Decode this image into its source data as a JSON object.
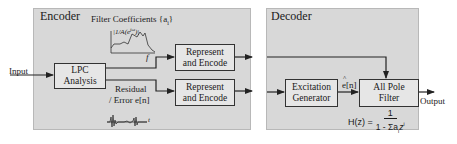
{
  "encoder": {
    "title": "Encoder",
    "lpc_box": "LPC\nAnalysis",
    "filter_coeff_label": "Filter Coefficients {a",
    "filter_coeff_sub": "i",
    "filter_coeff_close": "}",
    "spectrum_label": "|1/A(e",
    "spectrum_sup": "jω",
    "spectrum_close": ")|",
    "spectrum_axis": "f",
    "represent_top": "Represent\nand Encode",
    "represent_bottom": "Represent\nand Encode",
    "residual_label_1": "Residual",
    "residual_label_2": "/ Error e[n]",
    "residual_axis": "t"
  },
  "decoder": {
    "title": "Decoder",
    "excitation_box": "Excitation\nGenerator",
    "ehat_label": "e[n]",
    "ehat_hat": "^",
    "allpole_box": "All Pole\nFilter",
    "formula_lhs": "H(z) =",
    "formula_num": "1",
    "formula_den": "1 - Σa",
    "formula_den_sub": "i",
    "formula_den_z": "z",
    "formula_den_sup": "i"
  },
  "io": {
    "input_label": "Input",
    "output_label": "Output"
  },
  "colors": {
    "panel_bg": "#d8d8d8",
    "box_bg": "#e6e6e6",
    "line": "#333333"
  }
}
